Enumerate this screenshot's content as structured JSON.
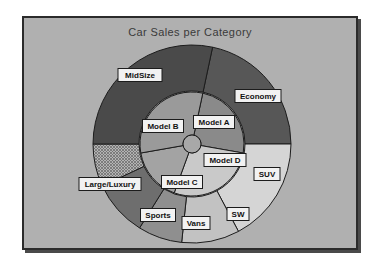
{
  "chart_data": {
    "type": "pie",
    "title": "Car Sales per Category",
    "subtitle": "",
    "xlabel": "",
    "ylabel": "",
    "legend_position": "none",
    "grid": false,
    "note": "Nested (multi-level) donut / sunburst pie chart. Inner ring = models, outer ring = categories.",
    "rings": [
      {
        "name": "Inner ring - Models",
        "inner_radius": 9,
        "outer_radius": 52,
        "slices": [
          {
            "label": "Model A",
            "value": 15,
            "start_angle": 12,
            "end_angle": 100,
            "color": "#8a8a8a",
            "pattern": "solid"
          },
          {
            "label": "Model D",
            "value": 18,
            "start_angle": 100,
            "end_angle": 200,
            "color": "#c9c9c9",
            "pattern": "solid"
          },
          {
            "label": "Model C",
            "value": 22,
            "start_angle": 200,
            "end_angle": 260,
            "color": "#a3a3a3",
            "pattern": "solid"
          },
          {
            "label": "Model B",
            "value": 45,
            "start_angle": 260,
            "end_angle": 372,
            "color": "#9a9a9a",
            "pattern": "solid"
          }
        ]
      },
      {
        "name": "Outer ring - Categories",
        "inner_radius": 53,
        "outer_radius": 99,
        "slices": [
          {
            "label": "Economy",
            "value": 22,
            "start_angle": 12,
            "end_angle": 90,
            "color": "#575757",
            "pattern": "solid"
          },
          {
            "label": "SUV",
            "value": 20,
            "start_angle": 90,
            "end_angle": 152,
            "color": "#d5d5d5",
            "pattern": "solid"
          },
          {
            "label": "SW",
            "value": 10,
            "start_angle": 152,
            "end_angle": 186,
            "color": "#c2c2c2",
            "pattern": "solid"
          },
          {
            "label": "Vans",
            "value": 8,
            "start_angle": 186,
            "end_angle": 212,
            "color": "#8f8f8f",
            "pattern": "solid"
          },
          {
            "label": "Sports",
            "value": 12,
            "start_angle": 212,
            "end_angle": 245,
            "color": "#6e6e6e",
            "pattern": "solid"
          },
          {
            "label": "Large/Luxury",
            "value": 14,
            "start_angle": 245,
            "end_angle": 270,
            "color": "#b4b4b4",
            "pattern": "hatch"
          },
          {
            "label": "MidSize",
            "value": 30,
            "start_angle": 270,
            "end_angle": 372,
            "color": "#4a4a4a",
            "pattern": "solid"
          }
        ]
      }
    ],
    "labels": [
      {
        "text": "MidSize",
        "x": 138,
        "y": 73,
        "w": 44,
        "h": 13
      },
      {
        "text": "Economy",
        "x": 256,
        "y": 94,
        "w": 46,
        "h": 13
      },
      {
        "text": "SUV",
        "x": 265,
        "y": 172,
        "w": 26,
        "h": 13
      },
      {
        "text": "SW",
        "x": 236,
        "y": 212,
        "w": 22,
        "h": 13
      },
      {
        "text": "Vans",
        "x": 194,
        "y": 221,
        "w": 28,
        "h": 13
      },
      {
        "text": "Sports",
        "x": 156,
        "y": 213,
        "w": 35,
        "h": 13
      },
      {
        "text": "Large/Luxury",
        "x": 108,
        "y": 182,
        "w": 62,
        "h": 13
      },
      {
        "text": "Model B",
        "x": 161,
        "y": 124,
        "w": 41,
        "h": 13
      },
      {
        "text": "Model A",
        "x": 212,
        "y": 120,
        "w": 41,
        "h": 13
      },
      {
        "text": "Model C",
        "x": 180,
        "y": 180,
        "w": 41,
        "h": 13
      },
      {
        "text": "Model D",
        "x": 223,
        "y": 158,
        "w": 42,
        "h": 13
      }
    ],
    "center": {
      "x": 190,
      "y": 142
    },
    "hub_radius": 9,
    "colors": {
      "background": "#b0b0b0",
      "frame_border": "#2b2b2b",
      "outline": "#1c1c1c",
      "title_text": "#3a3a3a",
      "label_box": "#f2f2f2",
      "label_text": "#111111"
    }
  }
}
